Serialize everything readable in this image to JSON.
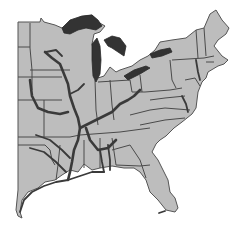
{
  "map": {
    "region": "Eastern United States",
    "colors": {
      "background": "#ffffff",
      "land": "#bdbdbd",
      "borders": "#4a4a4a",
      "rivers": "#3a3a3a",
      "lakes": "#333333"
    },
    "layers": [
      "state-boundaries",
      "rivers",
      "great-lakes"
    ]
  }
}
